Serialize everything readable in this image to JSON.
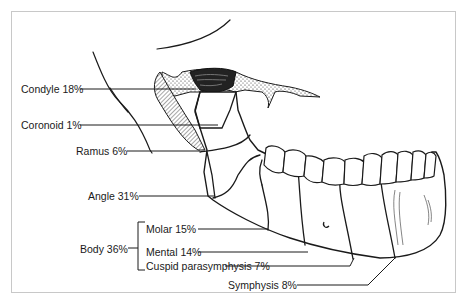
{
  "figure": {
    "labels": {
      "condyle": "Condyle 18%",
      "coronoid": "Coronoid 1%",
      "ramus": "Ramus 6%",
      "angle": "Angle 31%",
      "body": "Body 36%",
      "molar": "Molar 15%",
      "mental": "Mental 14%",
      "cuspid": "Cuspid parasymphysis 7%",
      "symphysis": "Symphysis 8%"
    },
    "regions": [
      {
        "name": "Condyle",
        "percent": 18
      },
      {
        "name": "Coronoid",
        "percent": 1
      },
      {
        "name": "Ramus",
        "percent": 6
      },
      {
        "name": "Angle",
        "percent": 31
      },
      {
        "name": "Body",
        "percent": 36,
        "subregions": [
          {
            "name": "Molar",
            "percent": 15
          },
          {
            "name": "Mental",
            "percent": 14
          },
          {
            "name": "Cuspid parasymphysis",
            "percent": 7
          }
        ]
      },
      {
        "name": "Symphysis",
        "percent": 8
      }
    ],
    "colors": {
      "ink": "#1a1a1a",
      "frame": "#c8c8c8",
      "background": "#ffffff"
    }
  }
}
